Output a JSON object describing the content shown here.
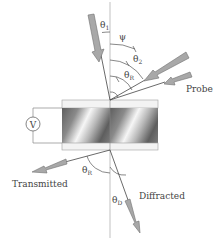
{
  "diagram": {
    "labels": {
      "theta1": "θ",
      "theta1_sub": "1",
      "psi": "ψ",
      "theta2": "θ",
      "theta2_sub": "2",
      "thetaR_top": "θ",
      "thetaR_top_sub": "R",
      "probe": "Probe",
      "voltmeter": "V",
      "transmitted": "Transmitted",
      "thetaR_bottom": "θ",
      "thetaR_bottom_sub": "R",
      "diffracted": "Diffracted",
      "thetaD": "θ",
      "thetaD_sub": "D"
    },
    "colors": {
      "line": "#444444",
      "arrow_fill": "#a8a8a8",
      "arrow_edge": "#6e6e6e",
      "normal_line": "#9a9a9a",
      "plate_fill": "#f2f2f2",
      "plate_edge": "#9a9a9a",
      "grating_light": "#f4f4f4",
      "grating_dark": "#6a6a6a"
    }
  }
}
